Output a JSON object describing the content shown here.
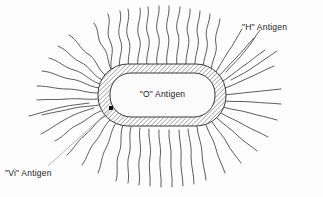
{
  "figure": {
    "type": "scientific-diagram",
    "background_color": "#fdfdfd",
    "ink_color": "#3a3a3a",
    "flagella_color": "#4a4a4a",
    "leader_color": "#9a9a9a",
    "marker_color": "#111111"
  },
  "labels": {
    "h_antigen": "\"H\" Antigen",
    "o_antigen": "\"O\" Antigen",
    "vi_antigen": "\"Vi\" Antigen"
  },
  "structures": {
    "capsule": {
      "name": "Vi antigen capsule",
      "fill": "diagonal-hatch"
    },
    "cell_core": {
      "name": "O antigen cell body",
      "fill": "#fbfbfb"
    },
    "flagella": {
      "name": "H antigen flagella",
      "count": 46
    }
  }
}
